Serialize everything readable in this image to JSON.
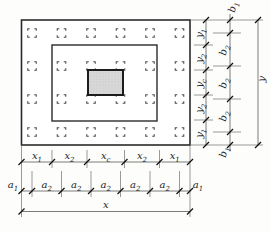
{
  "figure": {
    "kind": "foundation-slab-plan-diagram",
    "pile_grid": {
      "columns": 6,
      "rows": 4
    },
    "colors": {
      "pedestal_fill": "#d8d8d8",
      "line": "#2b2b2b",
      "paper": "#fdfdfc"
    }
  },
  "dims": {
    "x_chain": [
      {
        "b": "x",
        "s": "1"
      },
      {
        "b": "x",
        "s": "2"
      },
      {
        "b": "x",
        "s": "c"
      },
      {
        "b": "x",
        "s": "2"
      },
      {
        "b": "x",
        "s": "1"
      }
    ],
    "a_chain": [
      {
        "b": "a",
        "s": "1"
      },
      {
        "b": "a",
        "s": "2"
      },
      {
        "b": "a",
        "s": "2"
      },
      {
        "b": "a",
        "s": "2"
      },
      {
        "b": "a",
        "s": "2"
      },
      {
        "b": "a",
        "s": "2"
      },
      {
        "b": "a",
        "s": "1"
      }
    ],
    "x_total": {
      "b": "x",
      "s": ""
    },
    "y_chain": [
      {
        "b": "y",
        "s": "1"
      },
      {
        "b": "y",
        "s": "2"
      },
      {
        "b": "y",
        "s": "c"
      },
      {
        "b": "y",
        "s": "2"
      },
      {
        "b": "y",
        "s": "1"
      }
    ],
    "b_chain": [
      {
        "b": "b",
        "s": "1"
      },
      {
        "b": "b",
        "s": "2"
      },
      {
        "b": "b",
        "s": "2"
      },
      {
        "b": "b",
        "s": "2"
      },
      {
        "b": "b",
        "s": "1"
      }
    ],
    "y_total": {
      "b": "y",
      "s": ""
    }
  }
}
